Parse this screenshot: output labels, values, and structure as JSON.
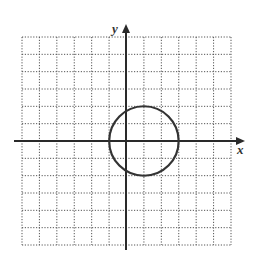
{
  "chart_data": {
    "type": "line",
    "title": "",
    "xlabel": "x",
    "ylabel": "y",
    "xlim": [
      -6,
      6
    ],
    "ylim": [
      -6,
      6
    ],
    "grid": true,
    "grid_style": "dotted",
    "grid_step": 1,
    "series": [
      {
        "name": "circle",
        "shape": "circle",
        "center": [
          1,
          0
        ],
        "radius": 2,
        "equation": "(x - 1)^2 + y^2 = 4"
      }
    ]
  },
  "axes": {
    "x_label": "x",
    "y_label": "y"
  },
  "colors": {
    "grid": "#555555",
    "axis": "#2a2a2a",
    "curve": "#333333",
    "background": "#ffffff"
  }
}
